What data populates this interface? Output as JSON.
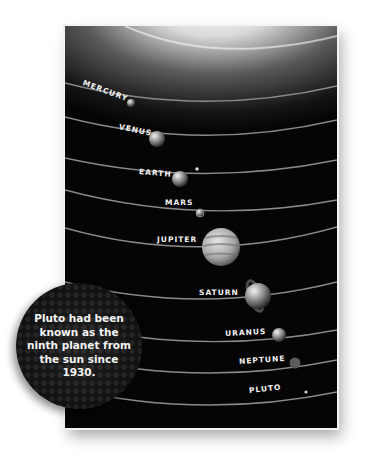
{
  "illustration": {
    "title": "Solar system orbits",
    "planets": [
      {
        "name": "MERCURY"
      },
      {
        "name": "VENUS"
      },
      {
        "name": "EARTH"
      },
      {
        "name": "MARS"
      },
      {
        "name": "JUPITER"
      },
      {
        "name": "SATURN"
      },
      {
        "name": "URANUS"
      },
      {
        "name": "NEPTUNE"
      },
      {
        "name": "PLUTO"
      }
    ]
  },
  "callout": {
    "text": "Pluto had been known as the ninth planet from the sun since 1930."
  },
  "colors": {
    "background": "#ffffff",
    "space": "#050505",
    "orbit": "#8a8a8a",
    "label": "#f2f2f2"
  }
}
